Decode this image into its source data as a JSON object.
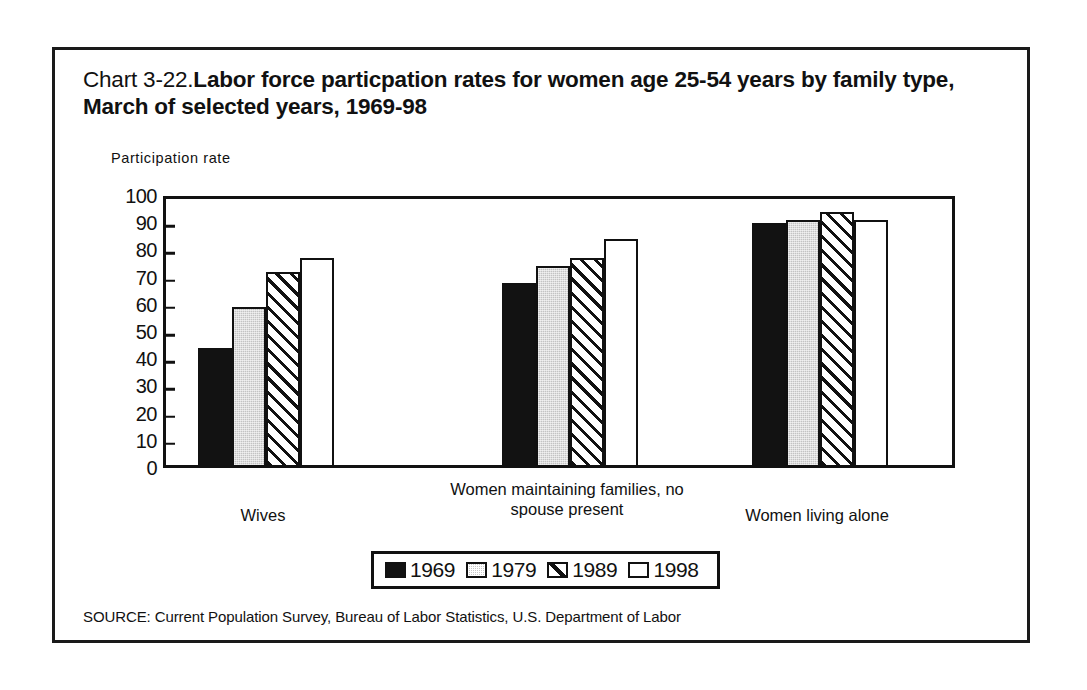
{
  "figure": {
    "title_number": "Chart 3-22.",
    "title_main": "Labor force particpation rates for women age 25-54 years by family type, March of selected years, 1969-98",
    "source": "SOURCE: Current Population Survey, Bureau of Labor Statistics, U.S. Department of Labor"
  },
  "chart_data": {
    "type": "bar",
    "title": "Chart 3-22.Labor force particpation rates for women age 25-54 years by family type, March of selected years, 1969-98",
    "xlabel": "",
    "ylabel": "Participation rate",
    "ylim": [
      0,
      100
    ],
    "yticks": [
      0,
      10,
      20,
      30,
      40,
      50,
      60,
      70,
      80,
      90,
      100
    ],
    "ytick_labels": [
      "0",
      "10",
      "20",
      "30",
      "40",
      "50",
      "60",
      "70",
      "80",
      "90",
      "100"
    ],
    "grid": false,
    "legend_position": "bottom-center",
    "categories": [
      "Wives",
      "Women maintaining families, no spouse present",
      "Women living alone"
    ],
    "series": [
      {
        "name": "1969",
        "fill": "solid-black",
        "values": [
          43,
          67,
          89
        ]
      },
      {
        "name": "1979",
        "fill": "gray",
        "values": [
          58,
          73,
          90
        ]
      },
      {
        "name": "1989",
        "fill": "diagonal-hatch",
        "values": [
          71,
          76,
          93
        ]
      },
      {
        "name": "1998",
        "fill": "white",
        "values": [
          76,
          83,
          90
        ]
      }
    ]
  }
}
